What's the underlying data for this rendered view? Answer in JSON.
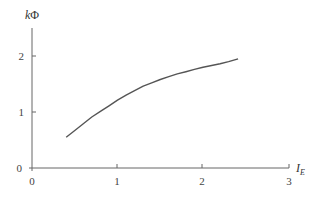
{
  "chart_data": {
    "type": "line",
    "title": "",
    "xlabel": "I_E",
    "xlabel_main": "I",
    "xlabel_sub": "E",
    "ylabel": "kΦ",
    "ylabel_k": "k",
    "ylabel_phi": "Φ",
    "xlim": [
      0,
      3
    ],
    "ylim": [
      0,
      2.5
    ],
    "xticks": [
      0,
      1,
      2,
      3
    ],
    "yticks": [
      0,
      1,
      2
    ],
    "xtick_labels": [
      "0",
      "1",
      "2",
      "3"
    ],
    "ytick_labels": [
      "0",
      "1",
      "2"
    ],
    "grid": false,
    "legend": null,
    "series": [
      {
        "name": "kΦ vs I_E",
        "color": "#555555",
        "x": [
          0.4,
          0.5,
          0.6,
          0.7,
          0.8,
          0.9,
          1.0,
          1.1,
          1.2,
          1.3,
          1.4,
          1.5,
          1.6,
          1.7,
          1.8,
          1.9,
          2.0,
          2.1,
          2.2,
          2.3,
          2.41
        ],
        "y": [
          0.55,
          0.67,
          0.79,
          0.91,
          1.01,
          1.11,
          1.21,
          1.3,
          1.38,
          1.46,
          1.52,
          1.58,
          1.63,
          1.68,
          1.72,
          1.76,
          1.8,
          1.83,
          1.86,
          1.9,
          1.95
        ]
      }
    ]
  }
}
